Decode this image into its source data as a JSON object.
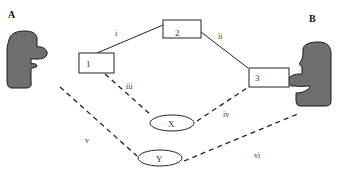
{
  "colors": {
    "ink": "#222222",
    "protein_fill": "#6e6e6e",
    "protein_edge": "#1a1a1a",
    "label": "#333333"
  },
  "molecules": {
    "A": {
      "label": "A"
    },
    "B": {
      "label": "B"
    }
  },
  "boxes": [
    {
      "id": "1",
      "label": "1"
    },
    {
      "id": "2",
      "label": "2"
    },
    {
      "id": "3",
      "label": "3"
    }
  ],
  "ellipses": [
    {
      "id": "X",
      "label": "X"
    },
    {
      "id": "Y",
      "label": "Y"
    }
  ],
  "edges": [
    {
      "id": "i",
      "label": "i",
      "from": "1",
      "to": "2",
      "style": "solid"
    },
    {
      "id": "ii",
      "label": "ii",
      "from": "2",
      "to": "3",
      "style": "solid"
    },
    {
      "id": "iii",
      "label": "iii",
      "from": "1",
      "to": "X",
      "style": "dashed"
    },
    {
      "id": "iv",
      "label": "iv",
      "from": "3",
      "to": "X",
      "style": "dashed"
    },
    {
      "id": "v",
      "label": "v",
      "from": "A",
      "to": "Y",
      "style": "dashed"
    },
    {
      "id": "vi",
      "label": "vi",
      "from": "B",
      "to": "Y",
      "style": "dashed"
    }
  ]
}
